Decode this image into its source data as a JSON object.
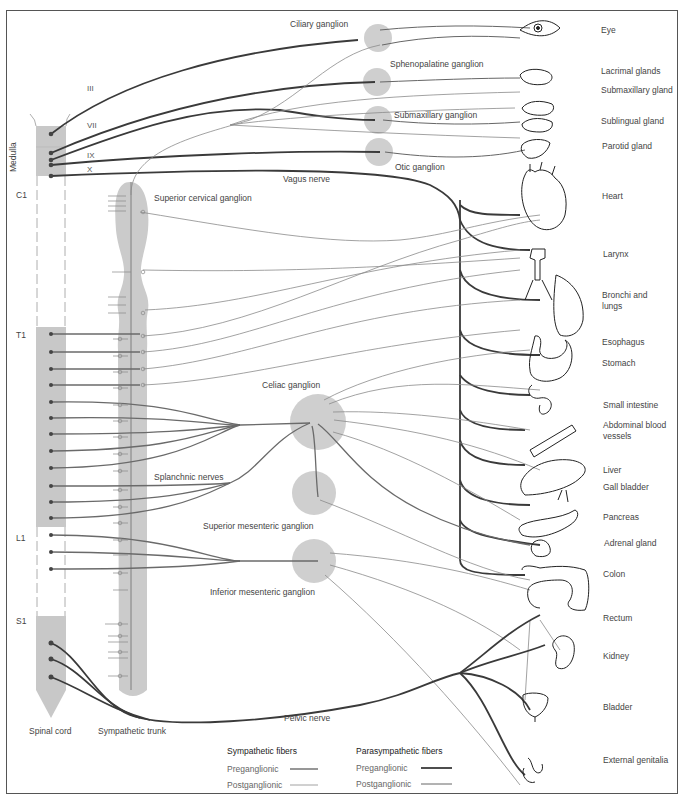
{
  "diagram": {
    "type": "anatomical schematic",
    "colors": {
      "preganglionic_sym": "#6a6a6a",
      "postganglionic_sym": "#8a8a8a",
      "preganglionic_para": "#3a3a3a",
      "postganglionic_para": "#666666",
      "ganglion_fill": "#cfcfcf",
      "cord_fill": "#c8c8c8",
      "frame": "#555555"
    },
    "spinal_levels": {
      "medulla": "Medulla",
      "c1": "C1",
      "t1": "T1",
      "l1": "L1",
      "s1": "S1"
    },
    "cranial_nerves": {
      "iii": "III",
      "vii": "VII",
      "ix": "IX",
      "x": "X"
    },
    "ganglia": {
      "ciliary": "Ciliary ganglion",
      "sphenopalatine": "Sphenopalatine ganglion",
      "submaxillary": "Submaxillary ganglion",
      "otic": "Otic ganglion",
      "superior_cervical": "Superior cervical ganglion",
      "celiac": "Celiac ganglion",
      "superior_mesenteric": "Superior mesenteric ganglion",
      "inferior_mesenteric": "Inferior mesenteric ganglion"
    },
    "nerves": {
      "vagus": "Vagus nerve",
      "splanchnic": "Splanchnic nerves",
      "pelvic": "Pelvic nerve"
    },
    "structures": {
      "spinal_cord": "Spinal cord",
      "sympathetic_trunk": "Sympathetic trunk"
    },
    "organs": [
      {
        "id": "eye",
        "label": "Eye"
      },
      {
        "id": "lacrimal",
        "label": "Lacrimal glands"
      },
      {
        "id": "submaxillary_gland",
        "label": "Submaxillary gland"
      },
      {
        "id": "sublingual",
        "label": "Sublingual gland"
      },
      {
        "id": "parotid",
        "label": "Parotid gland"
      },
      {
        "id": "heart",
        "label": "Heart"
      },
      {
        "id": "larynx",
        "label": "Larynx"
      },
      {
        "id": "bronchi",
        "label": "Bronchi and lungs"
      },
      {
        "id": "esophagus",
        "label": "Esophagus"
      },
      {
        "id": "stomach",
        "label": "Stomach"
      },
      {
        "id": "small_intestine",
        "label": "Small intestine"
      },
      {
        "id": "abdominal_vessels",
        "label": "Abdominal blood vessels"
      },
      {
        "id": "liver",
        "label": "Liver"
      },
      {
        "id": "gall_bladder",
        "label": "Gall bladder"
      },
      {
        "id": "pancreas",
        "label": "Pancreas"
      },
      {
        "id": "adrenal",
        "label": "Adrenal gland"
      },
      {
        "id": "colon",
        "label": "Colon"
      },
      {
        "id": "rectum",
        "label": "Rectum"
      },
      {
        "id": "kidney",
        "label": "Kidney"
      },
      {
        "id": "bladder",
        "label": "Bladder"
      },
      {
        "id": "genitalia",
        "label": "External genitalia"
      }
    ],
    "legend": {
      "sympathetic_title": "Sympathetic fibers",
      "parasympathetic_title": "Parasympathetic fibers",
      "preganglionic": "Preganglionic",
      "postganglionic": "Postganglionic"
    }
  }
}
